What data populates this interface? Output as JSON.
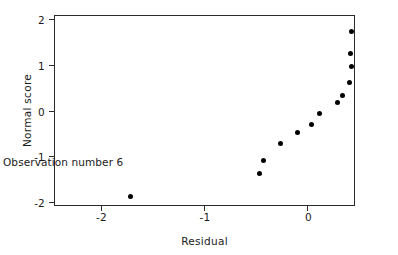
{
  "chart_data": {
    "type": "scatter",
    "title": "",
    "xlabel": "Residual",
    "ylabel": "Normal score",
    "xlim": [
      -2.44,
      0.45
    ],
    "ylim": [
      -2.06,
      2.06
    ],
    "xticks": [
      -2,
      -1,
      0
    ],
    "xticklabels": [
      "-2",
      "-1",
      "0"
    ],
    "yticks": [
      -2,
      -1,
      0,
      1,
      2
    ],
    "yticklabels": [
      "-2",
      "-1",
      "0",
      "1",
      "2"
    ],
    "grid": false,
    "legend": null,
    "marker": "filled-circle",
    "marker_color": "#000000",
    "points": [
      {
        "x": -1.71,
        "y": -1.87,
        "label": "Observation number 6"
      },
      {
        "x": -0.46,
        "y": -1.38,
        "label": ""
      },
      {
        "x": -0.42,
        "y": -1.09,
        "label": ""
      },
      {
        "x": -0.26,
        "y": -0.73,
        "label": ""
      },
      {
        "x": -0.1,
        "y": -0.47,
        "label": ""
      },
      {
        "x": 0.04,
        "y": -0.3,
        "label": ""
      },
      {
        "x": 0.12,
        "y": -0.06,
        "label": ""
      },
      {
        "x": 0.29,
        "y": 0.17,
        "label": ""
      },
      {
        "x": 0.34,
        "y": 0.33,
        "label": ""
      },
      {
        "x": 0.41,
        "y": 0.61,
        "label": ""
      },
      {
        "x": 0.43,
        "y": 0.96,
        "label": ""
      },
      {
        "x": 0.42,
        "y": 1.25,
        "label": ""
      },
      {
        "x": 0.43,
        "y": 1.72,
        "label": ""
      }
    ],
    "annotations": [
      {
        "text": "Observation number 6",
        "x": -2.34,
        "y": -1.48
      }
    ]
  },
  "axis": {
    "frame_color": "#2b2b2b",
    "background": "#ffffff"
  }
}
